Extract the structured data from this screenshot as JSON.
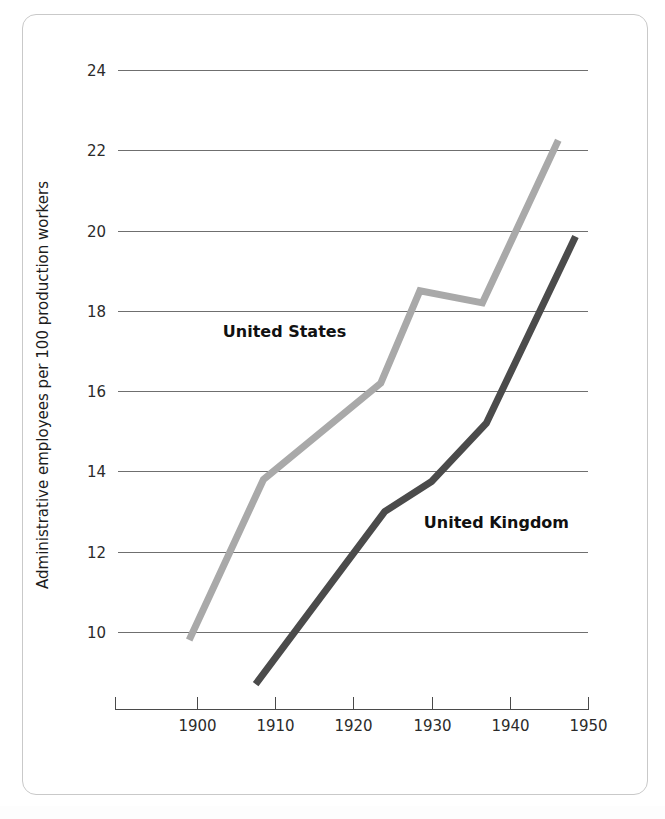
{
  "figure": {
    "border_color": "#c9c9c9",
    "background": "#ffffff"
  },
  "chart_data": {
    "type": "line",
    "title": "",
    "subtitle": "",
    "xlabel": "",
    "ylabel": "Administrative employees per 100 production workers",
    "xlim": [
      1894,
      1950
    ],
    "ylim": [
      8.2,
      24.4
    ],
    "xticks": [
      1900,
      1910,
      1920,
      1930,
      1940,
      1950
    ],
    "xtick_labels": [
      "1900",
      "1910",
      "1920",
      "1930",
      "1940",
      "1950"
    ],
    "yticks": [
      10,
      12,
      14,
      16,
      18,
      20,
      22,
      24
    ],
    "ytick_labels": [
      "10",
      "12",
      "14",
      "16",
      "18",
      "20",
      "22",
      "24"
    ],
    "grid": "horizontal",
    "legend": "inline-labels",
    "series": [
      {
        "name": "United States",
        "color": "#a9a9a9",
        "stroke_width": 7,
        "label_x": 1903.3,
        "label_y": 17.35,
        "x": [
          1899.0,
          1908.5,
          1923.5,
          1928.5,
          1936.5,
          1946.2
        ],
        "y": [
          9.8,
          13.8,
          16.2,
          18.5,
          18.2,
          22.25
        ]
      },
      {
        "name": "United Kingdom",
        "color": "#4b4b4b",
        "stroke_width": 7,
        "label_x": 1929.0,
        "label_y": 12.6,
        "x": [
          1907.5,
          1924.0,
          1930.0,
          1937.0,
          1948.4
        ],
        "y": [
          8.7,
          13.0,
          13.75,
          15.2,
          19.85
        ]
      }
    ]
  }
}
